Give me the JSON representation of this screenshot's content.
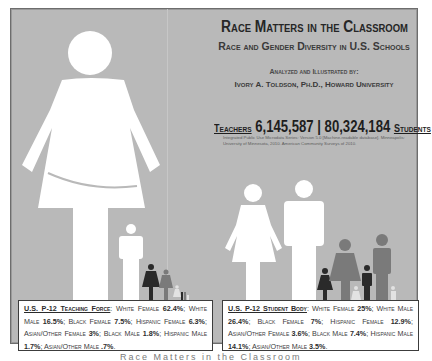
{
  "title": "Race Matters in the Classroom",
  "subtitle": "Race and Gender Diversity in U.S. Schools",
  "byline_label": "Analyzed and Illustrated by:",
  "author": "Ivory A. Toldson, Ph.D., Howard University",
  "counts": {
    "teachers_label": "Teachers",
    "teachers_value": "6,145,587",
    "separator": "|",
    "students_value": "80,324,184",
    "students_label": "Students"
  },
  "citation": "Integrated Public Use Microdata Series: Version 5.0 [Machine-readable database]. Minneapolis: University of Minnesota, 2010. American Community Surveys of 2010.",
  "teaching_force": {
    "heading": "U.S. P-12 Teaching Force",
    "items": [
      {
        "label": "White Female",
        "value": "62.4%"
      },
      {
        "label": "White Male",
        "value": "16.5%"
      },
      {
        "label": "Black Female",
        "value": "7.5%"
      },
      {
        "label": "Hispanic Female",
        "value": "6.3%"
      },
      {
        "label": "Asian/Other Female",
        "value": "3%"
      },
      {
        "label": "Black Male",
        "value": "1.8%"
      },
      {
        "label": "Hispanic Male",
        "value": "1.7%"
      },
      {
        "label": "Asian/Other Male",
        "value": ".7%"
      }
    ]
  },
  "student_body": {
    "heading": "U.S. P-12 Student Body",
    "items": [
      {
        "label": "White Female",
        "value": "25%"
      },
      {
        "label": "White Male",
        "value": "26.4%"
      },
      {
        "label": "Black Female",
        "value": "7%"
      },
      {
        "label": "Hispanic Female",
        "value": "12.9%"
      },
      {
        "label": "Asian/Other Female",
        "value": "3.6%"
      },
      {
        "label": "Black Male",
        "value": "7.4%"
      },
      {
        "label": "Hispanic Male",
        "value": "14.1%"
      },
      {
        "label": "Asian/Other Male",
        "value": "3.5%"
      }
    ]
  },
  "colors": {
    "background": "#b9b9b9",
    "white_figure": "#ffffff",
    "black_figure": "#2a2a2a",
    "hispanic_figure": "#7a7a7a",
    "asian_figure": "#e2e2e2"
  },
  "caption": "Race Matters in the Classroom"
}
